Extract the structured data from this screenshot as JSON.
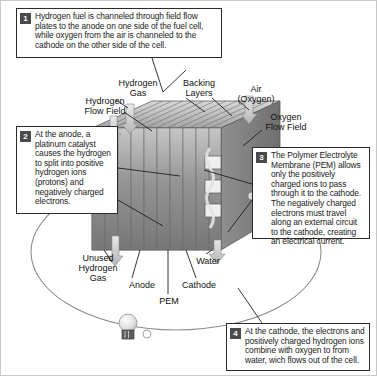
{
  "diagram": {
    "callouts": [
      {
        "number": "1",
        "text": "Hydrogen fuel is channeled through field flow plates to the anode on one side of the fuel cell, while oxygen from the air is channeled to the cathode on the other side of the cell."
      },
      {
        "number": "2",
        "text": "At the anode, a platinum catalyst causes the hydrogen to split into positive hydrogen ions (protons) and negatively charged electrons."
      },
      {
        "number": "3",
        "text": "The Polymer Electrolyte Membrane (PEM) allows only the positively charged ions to pass through it to the cathode. The negatively charged electrons must travel along an external circuit to the cathode, creating an electrical current."
      },
      {
        "number": "4",
        "text": "At the cathode, the electrons and positively charged hydrogen ions combine with oxygen to from water, wich flows out of the cell."
      }
    ],
    "labels": {
      "hydrogen_flow_field": "Hydrogen\nFlow Field",
      "hydrogen_gas": "Hydrogen\nGas",
      "backing_layers": "Backing\nLayers",
      "air_oxygen": "Air\n(Oxygen)",
      "oxygen_flow_field": "Oxygen\nFlow Field",
      "unused_hydrogen_gas": "Unused\nHydrogen\nGas",
      "anode": "Anode",
      "pem": "PEM",
      "cathode": "Cathode",
      "water": "Water"
    },
    "icons": {
      "lightbulb": "lightbulb-icon",
      "circuit": "external-circuit-loop"
    },
    "colors": {
      "stack_dark": "#7d7d7d",
      "stack_mid": "#9a9a9a",
      "stack_light": "#c2c2c2",
      "line": "#2b2b2b",
      "badge": "#4a4a4a",
      "frame": "#c9c9c9"
    }
  }
}
